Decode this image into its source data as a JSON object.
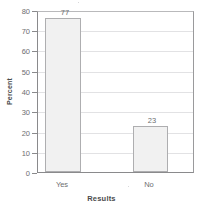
{
  "chart_data": {
    "type": "bar",
    "title": "",
    "subtitle": "",
    "categories": [
      "Yes",
      "No"
    ],
    "values": [
      77,
      23
    ],
    "data_labels": [
      "77",
      "23"
    ],
    "xlabel": "Results",
    "ylabel": "Percent",
    "ylim": [
      0,
      80
    ],
    "ytick_labels": [
      "0",
      "10",
      "20",
      "30",
      "40",
      "50",
      "60",
      "70",
      "80"
    ],
    "ytick_values": [
      0,
      10,
      20,
      30,
      40,
      50,
      60,
      70,
      80
    ],
    "grid": "horizontal",
    "legend": "none",
    "series": [
      {
        "name": "Percent",
        "values": [
          77,
          23
        ]
      }
    ],
    "colors": {
      "bar_fill": "#f1f1f1",
      "bar_border": "#aeaeb0",
      "gridline": "#e2e2e4",
      "axis": "#8a8a8c",
      "text": "#6d6e70",
      "title_text": "#4a4a4c"
    }
  }
}
